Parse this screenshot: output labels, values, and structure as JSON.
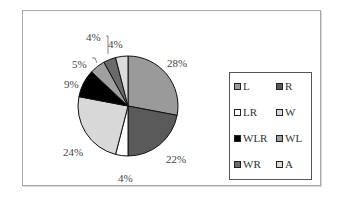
{
  "chart_data": {
    "type": "pie",
    "title": "",
    "start_angle": "12 o'clock",
    "direction": "clockwise",
    "categories": [
      "L",
      "R",
      "LR",
      "W",
      "WLR",
      "WL",
      "WR",
      "A"
    ],
    "values": [
      28,
      22,
      4,
      24,
      9,
      5,
      4,
      4
    ],
    "labels": [
      "28%",
      "22%",
      "4%",
      "24%",
      "9%",
      "5%",
      "4%",
      "4%"
    ],
    "colors": [
      "#9a9a9a",
      "#5a5a5a",
      "#ffffff",
      "#d8d8d8",
      "#000000",
      "#a0a0a0",
      "#6a6a6a",
      "#dcdcdc"
    ],
    "legend": {
      "position": "right",
      "entries": [
        "L",
        "R",
        "LR",
        "W",
        "WLR",
        "WL",
        "WR",
        "A"
      ]
    }
  }
}
